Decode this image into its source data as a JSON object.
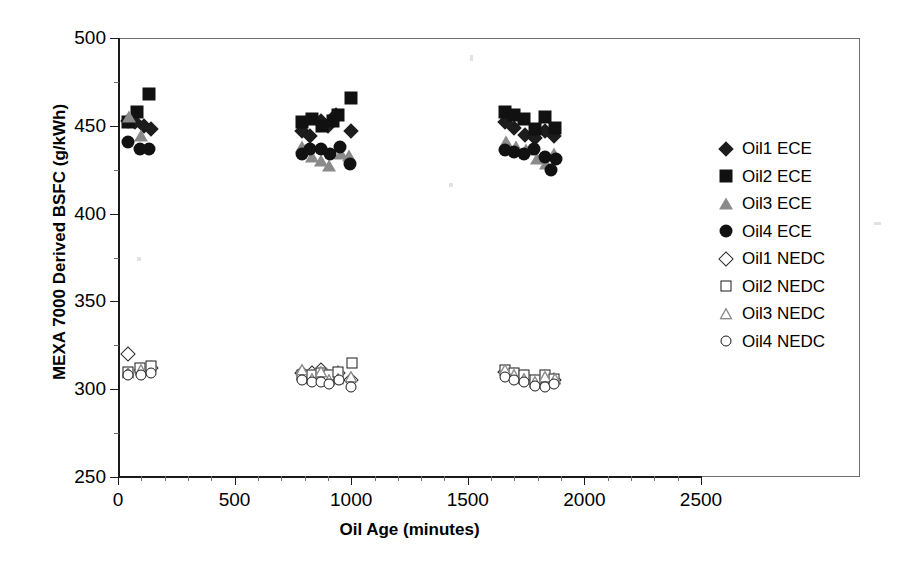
{
  "chart_data": {
    "type": "scatter",
    "title": "",
    "xlabel": "Oil Age (minutes)",
    "ylabel": "MEXA 7000 Derived BSFC (g/kWh)",
    "xlim": [
      0,
      2500
    ],
    "ylim": [
      250,
      500
    ],
    "xticks": [
      0,
      500,
      1000,
      1500,
      2000,
      2500
    ],
    "yticks": [
      250,
      300,
      350,
      400,
      450,
      500
    ],
    "grid": false,
    "legend_position": "right-outside",
    "series": [
      {
        "name": "Oil1 ECE",
        "marker": "diamond-filled",
        "color": "#1c1c1c",
        "points": [
          [
            45,
            453
          ],
          [
            75,
            452
          ],
          [
            110,
            450
          ],
          [
            140,
            448
          ],
          [
            790,
            447
          ],
          [
            825,
            444
          ],
          [
            870,
            453
          ],
          [
            900,
            450
          ],
          [
            935,
            456
          ],
          [
            1000,
            447
          ],
          [
            1660,
            452
          ],
          [
            1700,
            449
          ],
          [
            1745,
            445
          ],
          [
            1790,
            443
          ],
          [
            1830,
            447
          ],
          [
            1870,
            444
          ]
        ]
      },
      {
        "name": "Oil2 ECE",
        "marker": "square-filled",
        "color": "#111111",
        "points": [
          [
            45,
            452
          ],
          [
            80,
            458
          ],
          [
            135,
            468
          ],
          [
            790,
            452
          ],
          [
            830,
            454
          ],
          [
            875,
            450
          ],
          [
            920,
            453
          ],
          [
            945,
            456
          ],
          [
            1000,
            466
          ],
          [
            1660,
            458
          ],
          [
            1700,
            456
          ],
          [
            1740,
            454
          ],
          [
            1790,
            448
          ],
          [
            1830,
            455
          ],
          [
            1875,
            449
          ]
        ]
      },
      {
        "name": "Oil3 ECE",
        "marker": "triangle-filled",
        "color": "#8a8a8a",
        "points": [
          [
            48,
            455
          ],
          [
            100,
            444
          ],
          [
            790,
            438
          ],
          [
            830,
            432
          ],
          [
            870,
            430
          ],
          [
            905,
            427
          ],
          [
            955,
            434
          ],
          [
            990,
            433
          ],
          [
            1665,
            441
          ],
          [
            1705,
            438
          ],
          [
            1750,
            436
          ],
          [
            1795,
            431
          ],
          [
            1835,
            428
          ],
          [
            1870,
            434
          ]
        ]
      },
      {
        "name": "Oil4 ECE",
        "marker": "circle-filled",
        "color": "#111111",
        "points": [
          [
            45,
            441
          ],
          [
            95,
            437
          ],
          [
            135,
            437
          ],
          [
            790,
            434
          ],
          [
            825,
            437
          ],
          [
            870,
            437
          ],
          [
            910,
            434
          ],
          [
            950,
            438
          ],
          [
            995,
            428
          ],
          [
            1660,
            436
          ],
          [
            1700,
            435
          ],
          [
            1740,
            434
          ],
          [
            1785,
            437
          ],
          [
            1830,
            432
          ],
          [
            1855,
            425
          ],
          [
            1880,
            431
          ]
        ]
      },
      {
        "name": "Oil1 NEDC",
        "marker": "diamond-open",
        "color": "#2a2a2a",
        "points": [
          [
            45,
            320
          ],
          [
            100,
            311
          ],
          [
            140,
            312
          ],
          [
            790,
            309
          ],
          [
            830,
            309
          ],
          [
            870,
            311
          ],
          [
            905,
            307
          ],
          [
            945,
            309
          ],
          [
            1000,
            305
          ],
          [
            1660,
            310
          ],
          [
            1700,
            308
          ],
          [
            1745,
            307
          ],
          [
            1790,
            304
          ],
          [
            1830,
            307
          ],
          [
            1870,
            305
          ]
        ]
      },
      {
        "name": "Oil2 NEDC",
        "marker": "square-open",
        "color": "#1a1a1a",
        "points": [
          [
            45,
            310
          ],
          [
            95,
            312
          ],
          [
            140,
            313
          ],
          [
            790,
            308
          ],
          [
            830,
            308
          ],
          [
            870,
            309
          ],
          [
            905,
            308
          ],
          [
            945,
            310
          ],
          [
            1005,
            315
          ],
          [
            1660,
            311
          ],
          [
            1700,
            309
          ],
          [
            1740,
            308
          ],
          [
            1790,
            305
          ],
          [
            1830,
            308
          ],
          [
            1870,
            306
          ]
        ]
      },
      {
        "name": "Oil3 NEDC",
        "marker": "triangle-open",
        "color": "#8a8a8a",
        "points": [
          [
            45,
            309
          ],
          [
            100,
            311
          ],
          [
            790,
            311
          ],
          [
            830,
            306
          ],
          [
            870,
            310
          ],
          [
            905,
            305
          ],
          [
            945,
            306
          ],
          [
            1000,
            307
          ],
          [
            1660,
            311
          ],
          [
            1700,
            308
          ],
          [
            1742,
            306
          ],
          [
            1790,
            304
          ],
          [
            1832,
            307
          ],
          [
            1872,
            306
          ]
        ]
      },
      {
        "name": "Oil4 NEDC",
        "marker": "circle-open",
        "color": "#1a1a1a",
        "points": [
          [
            45,
            308
          ],
          [
            97,
            308
          ],
          [
            140,
            309
          ],
          [
            790,
            305
          ],
          [
            830,
            304
          ],
          [
            870,
            304
          ],
          [
            905,
            303
          ],
          [
            948,
            305
          ],
          [
            1000,
            301
          ],
          [
            1660,
            307
          ],
          [
            1700,
            305
          ],
          [
            1740,
            304
          ],
          [
            1788,
            302
          ],
          [
            1830,
            301
          ],
          [
            1870,
            303
          ]
        ]
      }
    ]
  },
  "axes": {
    "y_title": "MEXA 7000 Derived BSFC (g/kWh)",
    "x_title": "Oil Age (minutes)",
    "y_ticklabels": [
      "500",
      "450",
      "400",
      "350",
      "300",
      "250"
    ],
    "x_ticklabels": [
      "0",
      "500",
      "1000",
      "1500",
      "2000",
      "2500"
    ]
  },
  "legend": {
    "items": [
      {
        "label": "Oil1 ECE",
        "marker": "diamond-filled"
      },
      {
        "label": "Oil2 ECE",
        "marker": "square-filled"
      },
      {
        "label": "Oil3 ECE",
        "marker": "triangle-filled"
      },
      {
        "label": "Oil4 ECE",
        "marker": "circle-filled"
      },
      {
        "label": "Oil1 NEDC",
        "marker": "diamond-open"
      },
      {
        "label": "Oil2 NEDC",
        "marker": "square-open"
      },
      {
        "label": "Oil3 NEDC",
        "marker": "triangle-open"
      },
      {
        "label": "Oil4 NEDC",
        "marker": "circle-open"
      }
    ]
  },
  "colors": {
    "axis": "#1a1a1a",
    "frame": "#6f6f6f",
    "marker_dark": "#111111",
    "marker_gray": "#8a8a8a",
    "background": "#ffffff"
  }
}
